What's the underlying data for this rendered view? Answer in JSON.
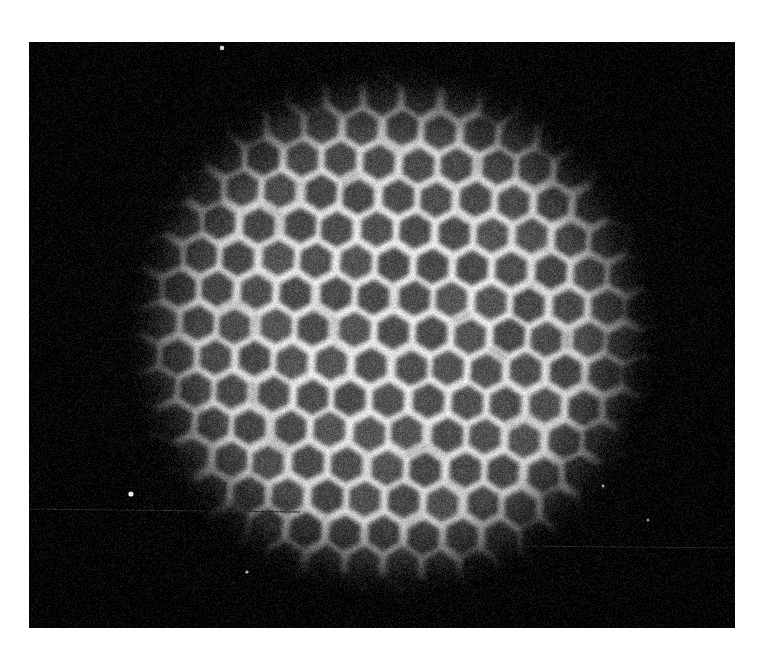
{
  "document": {
    "kind": "scientific-photograph",
    "subject": "hexagonal-cell-lattice-micrograph",
    "page_background": "#ffffff",
    "width": 759,
    "height": 654
  },
  "photo": {
    "name": "hexagonal-lattice-photograph",
    "left": 29,
    "top": 42,
    "width": 706,
    "height": 586,
    "background_color": "#050505",
    "border_color": "#ffffff"
  },
  "lattice": {
    "type": "hexagonal-close-packed",
    "center_x": 392,
    "center_y": 332,
    "radius": 252,
    "pitch": 39.0,
    "rotation_deg": 2.5,
    "cell_fill_color": "#585858",
    "cell_fill_color_dim": "#3a3a3a",
    "wall_color": "#ececec",
    "wall_width": 6.0,
    "wall_glow": 5.0,
    "cell_inset": 0.8,
    "approx_cell_count": 230,
    "rows": 15,
    "columns": 15
  },
  "boundary": {
    "name": "radial-spike-fringe",
    "description": "outer cells elongate radially into tapered spikes fading into the dark field",
    "spike_count": 34,
    "spike_length_min": 22,
    "spike_length_max": 62,
    "spike_color": "#3c3c3c"
  },
  "illumination": {
    "vignette": true,
    "center_brightness": 1.0,
    "edge_brightness": 0.16,
    "falloff_start": 0.42,
    "falloff_end": 1.06,
    "grain_amount": 0.17,
    "grain_scale": 1
  },
  "artifacts": {
    "specks": [
      {
        "name": "dust-speck-top",
        "x": 222,
        "y": 48,
        "r": 2.3,
        "color": "#d8d8d8"
      },
      {
        "name": "dust-speck-left",
        "x": 131,
        "y": 494,
        "r": 2.6,
        "color": "#f0f0f0"
      },
      {
        "name": "dust-speck-lower",
        "x": 247,
        "y": 572,
        "r": 1.6,
        "color": "#b8b8b8"
      },
      {
        "name": "dust-speck-right",
        "x": 648,
        "y": 520,
        "r": 1.5,
        "color": "#9a9a9a"
      },
      {
        "name": "dust-speck-midright",
        "x": 603,
        "y": 486,
        "r": 1.4,
        "color": "#a6a6a6"
      }
    ],
    "scratches": [
      {
        "name": "scan-line-lower-left",
        "x1": 30,
        "y1": 509,
        "x2": 300,
        "y2": 512,
        "color": "#2a2a2a",
        "width": 1.0
      },
      {
        "name": "scan-line-lower-right",
        "x1": 520,
        "y1": 546,
        "x2": 735,
        "y2": 548,
        "color": "#262626",
        "width": 1.0
      }
    ]
  },
  "caption": {
    "visible_text": ""
  }
}
